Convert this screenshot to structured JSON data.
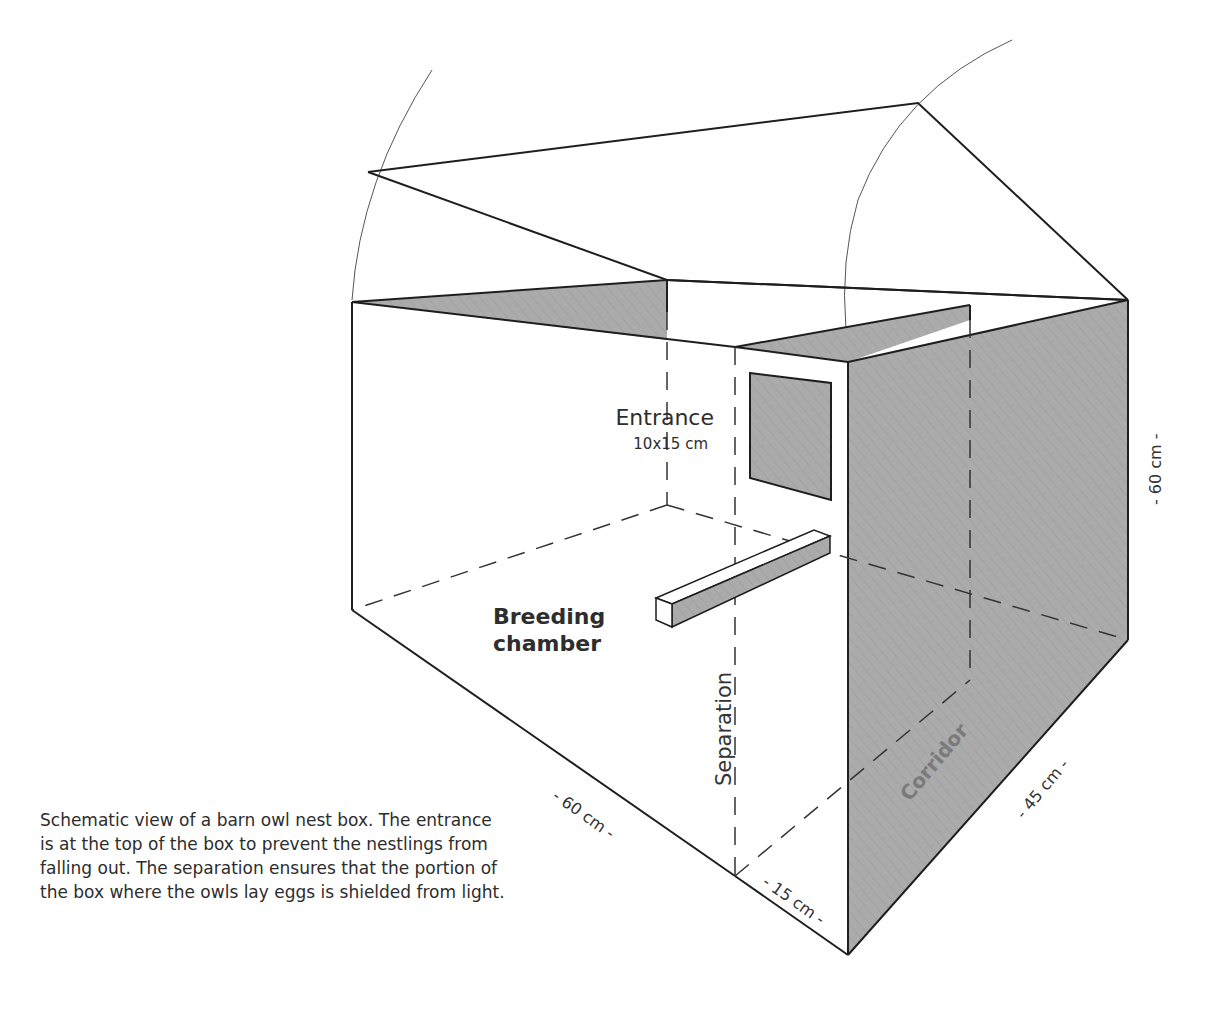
{
  "diagram": {
    "labels": {
      "entrance": "Entrance",
      "entrance_size": "10x15 cm",
      "breeding_line1": "Breeding",
      "breeding_line2": "chamber",
      "separation": "Separation",
      "corridor": "Corridor"
    },
    "dimensions": {
      "length": "- 60 cm -",
      "separation_gap": "- 15 cm -",
      "depth": "- 45 cm -",
      "height": "- 60 cm -"
    },
    "colors": {
      "line": "#1e1e1e",
      "shade": "#a9a9a9",
      "dashed": "#333333",
      "corridor_text": "#7a7a7a"
    }
  },
  "caption": {
    "text": "Schematic view of a barn owl nest box. The entrance is at the top of the box to prevent the nestlings from falling out. The separation ensures that the portion of the box where the owls lay eggs is shielded from light."
  }
}
